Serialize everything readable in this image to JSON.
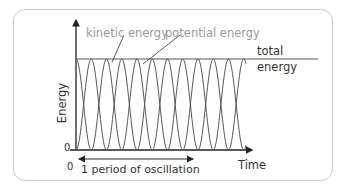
{
  "diagram": {
    "labels": {
      "kinetic": "kinetic energy",
      "potential": "potential energy",
      "total_line1": "total",
      "total_line2": "energy",
      "y_axis": "Energy",
      "x_axis": "Time",
      "origin_y": "0",
      "origin_x": "0",
      "period": "1 period of oscillation"
    },
    "colors": {
      "curves": "#555555",
      "axes": "#222222",
      "label_grey": "#999999"
    }
  }
}
